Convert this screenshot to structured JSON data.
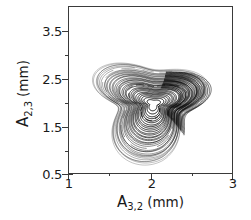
{
  "figure": {
    "background_color": "#ffffff",
    "line_color": "#000000",
    "axis_color": "#3a3a3a"
  },
  "axes": {
    "x": {
      "title_symbol": "A",
      "title_subscript": "3,2",
      "title_unit": "(mm)",
      "major_ticks": [
        "1",
        "2",
        "3"
      ],
      "minor_ticks": [
        "1.5",
        "2.5"
      ],
      "range": [
        1,
        3
      ]
    },
    "y": {
      "title_symbol": "A",
      "title_subscript": "2,3",
      "title_unit": "(mm)",
      "major_ticks": [
        "3.5",
        "2.5",
        "1.5",
        "0.5"
      ],
      "minor_ticks": [
        "3.0",
        "2.0",
        "1.0"
      ],
      "range": [
        0.5,
        3.75
      ]
    }
  },
  "chart_data": {
    "type": "line",
    "title": "",
    "xlabel": "A_{3,2} (mm)",
    "ylabel": "A_{2,3} (mm)",
    "xlim": [
      1,
      3
    ],
    "ylim": [
      0.5,
      3.75
    ],
    "grid": false,
    "legend": "none",
    "series": [
      {
        "name": "attractor-trajectory",
        "center": [
          2.02,
          1.88
        ],
        "envelope_apex": [
          1.81,
          3.47
        ],
        "envelope_left": [
          1.36,
          1.55
        ],
        "envelope_right": [
          2.66,
          1.82
        ],
        "envelope_bottom": [
          1.92,
          0.8
        ],
        "loop_count": 34,
        "core_hole_center": [
          2.03,
          1.9
        ],
        "core_hole_radius": [
          0.085,
          0.105
        ]
      }
    ]
  }
}
